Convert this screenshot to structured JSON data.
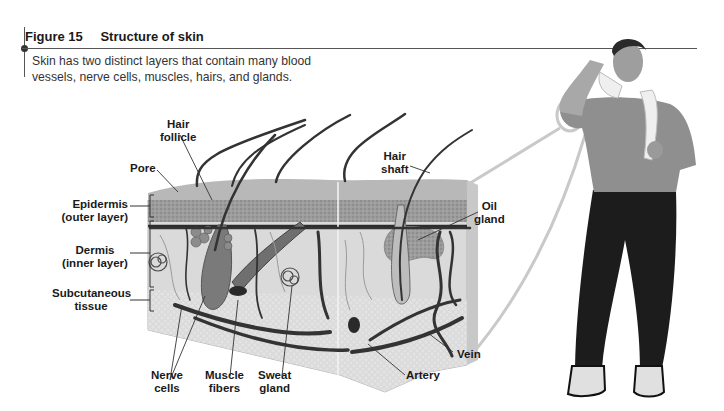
{
  "figure": {
    "number": "Figure 15",
    "title": "Structure of skin",
    "caption_line1": "Skin has two distinct layers that contain many blood",
    "caption_line2": "vessels, nerve cells, muscles, hairs, and glands."
  },
  "labels": {
    "hair_follicle_1": "Hair",
    "hair_follicle_2": "follicle",
    "pore": "Pore",
    "epidermis_1": "Epidermis",
    "epidermis_2": "(outer layer)",
    "dermis_1": "Dermis",
    "dermis_2": "(inner layer)",
    "subcutaneous_1": "Subcutaneous",
    "subcutaneous_2": "tissue",
    "hair_shaft_1": "Hair",
    "hair_shaft_2": "shaft",
    "oil_gland_1": "Oil",
    "oil_gland_2": "gland",
    "nerve_cells_1": "Nerve",
    "nerve_cells_2": "cells",
    "muscle_fibers_1": "Muscle",
    "muscle_fibers_2": "fibers",
    "sweat_gland_1": "Sweat",
    "sweat_gland_2": "gland",
    "artery": "Artery",
    "vein": "Vein"
  },
  "colors": {
    "epidermis": "#9a9a9a",
    "dermis": "#d9d9d9",
    "subcutaneous": "#e6e6e6",
    "vessels": "#3a3a3a",
    "pants": "#1c1c1c",
    "shirt": "#8f8f8f"
  }
}
